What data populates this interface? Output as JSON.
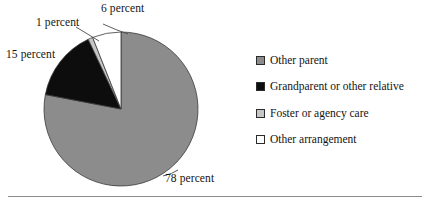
{
  "chart_data": {
    "type": "pie",
    "title": "",
    "categories": [
      "Other parent",
      "Grandparent or other relative",
      "Foster or agency care",
      "Other arrangement"
    ],
    "values": [
      78,
      15,
      1,
      6
    ],
    "value_unit": "percent",
    "data_labels": [
      "78 percent",
      "15 percent",
      "1 percent",
      "6 percent"
    ],
    "colors": [
      "#8c8c8c",
      "#0d0d0d",
      "#c6c6c6",
      "#ffffff"
    ],
    "start_angle_deg": 0,
    "direction": "clockwise",
    "legend_position": "right",
    "grid": false
  },
  "callouts": {
    "six": "6 percent",
    "one": "1 percent",
    "fifteen": "15 percent",
    "seventyeight": "78 percent"
  },
  "legend": {
    "items": [
      {
        "label": "Other parent",
        "color": "#8c8c8c"
      },
      {
        "label": "Grandparent or other relative",
        "color": "#0d0d0d"
      },
      {
        "label": "Foster or agency care",
        "color": "#c6c6c6"
      },
      {
        "label": "Other arrangement",
        "color": "#ffffff"
      }
    ]
  },
  "geometry": {
    "cx": 121,
    "cy": 109,
    "r": 77
  },
  "style": {
    "slice_stroke": "#3a3a3a",
    "leader_line": "#4a4a4a",
    "rule_color": "#8c8c8c"
  }
}
